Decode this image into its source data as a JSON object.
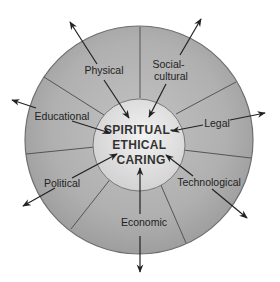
{
  "diagram": {
    "center": {
      "lines": [
        "SPIRITUAL-",
        "ETHICAL",
        "CARING"
      ]
    },
    "factors": [
      {
        "id": "physical",
        "lines": [
          "Physical"
        ]
      },
      {
        "id": "social-cultural",
        "lines": [
          "Social-",
          "cultural"
        ]
      },
      {
        "id": "legal",
        "lines": [
          "Legal"
        ]
      },
      {
        "id": "technological",
        "lines": [
          "Technological"
        ]
      },
      {
        "id": "economic",
        "lines": [
          "Economic"
        ]
      },
      {
        "id": "political",
        "lines": [
          "Political"
        ]
      },
      {
        "id": "educational",
        "lines": [
          "Educational"
        ]
      }
    ],
    "colors": {
      "outer_ring": "#a9a9a9",
      "outer_ring_edge": "#6e6e6e",
      "inner_circle": "#e4e4e4",
      "lines": "#333333",
      "text": "#222222"
    }
  }
}
